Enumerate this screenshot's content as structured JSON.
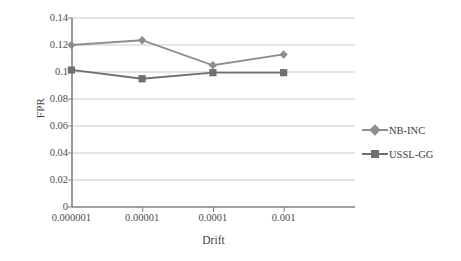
{
  "chart_data": {
    "type": "line",
    "title": "",
    "xlabel": "Drift",
    "ylabel": "FPR",
    "categories": [
      "0.000001",
      "0.00001",
      "0.0001",
      "0.001"
    ],
    "yticks": [
      "0",
      "0.02",
      "0.04",
      "0.06",
      "0.08",
      "0.1",
      "0.12",
      "0.14"
    ],
    "ytick_values": [
      0,
      0.02,
      0.04,
      0.06,
      0.08,
      0.1,
      0.12,
      0.14
    ],
    "ylim": [
      0,
      0.14
    ],
    "grid": "horizontal",
    "legend_position": "right",
    "series": [
      {
        "name": "NB-INC",
        "marker": "diamond",
        "color": "#8e8e8e",
        "values": [
          0.12,
          0.1235,
          0.105,
          0.113
        ]
      },
      {
        "name": "USSL-GG",
        "marker": "square",
        "color": "#707070",
        "values": [
          0.1015,
          0.095,
          0.0995,
          0.0995
        ]
      }
    ]
  },
  "axes": {
    "y_title": "FPR",
    "x_title": "Drift"
  },
  "colors": {
    "grid": "#c9c9c9",
    "axis": "#808080",
    "series_1": "#8e8e8e",
    "series_2": "#707070",
    "background": "#ffffff"
  }
}
